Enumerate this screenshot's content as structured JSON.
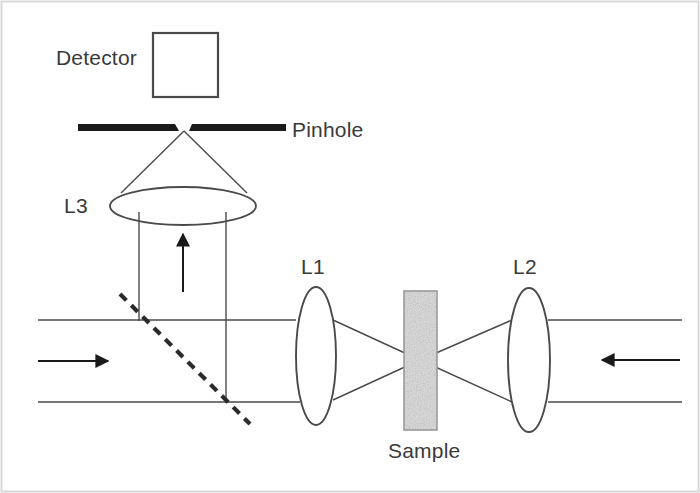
{
  "figure": {
    "kind": "optical-setup-diagram",
    "background_color": "#ffffff",
    "border_color": "#d8d8d8",
    "stroke_color": "#4a4a4a",
    "text_color": "#3a3a3a",
    "solid_black": "#1a1a1a",
    "sample_fill": "#d2d2d2",
    "sample_stroke": "#9a9a9a",
    "canvas": {
      "width": 700,
      "height": 493
    }
  },
  "labels": {
    "detector": "Detector",
    "pinhole": "Pinhole",
    "l3": "L3",
    "l1": "L1",
    "l2": "L2",
    "sample": "Sample"
  },
  "components": {
    "detector_box": {
      "x": 153,
      "y": 33,
      "width": 65,
      "height": 64
    },
    "pinhole_left_bar": {
      "x1": 78,
      "y1": 127,
      "x2": 177,
      "y2": 127,
      "thickness": 7
    },
    "pinhole_right_bar": {
      "x1": 191,
      "y1": 127,
      "x2": 285,
      "y2": 127,
      "thickness": 7
    },
    "pinhole_gap": {
      "center_x": 184,
      "y": 128,
      "width": 14
    },
    "lens_l3": {
      "cx": 183,
      "cy": 206,
      "rx": 73,
      "ry": 19,
      "orientation": "horizontal"
    },
    "lens_l1": {
      "cx": 316,
      "cy": 356,
      "rx": 20,
      "ry": 69,
      "orientation": "vertical"
    },
    "lens_l2": {
      "cx": 529,
      "cy": 360,
      "rx": 21,
      "ry": 72,
      "orientation": "vertical"
    },
    "sample_block": {
      "x": 404,
      "y": 291,
      "width": 33,
      "height": 139
    },
    "beamsplitter": {
      "x1": 120,
      "y1": 294,
      "x2": 250,
      "y2": 424,
      "style": "dashed",
      "angle_deg": 45
    },
    "focal_point": {
      "x": 420,
      "y": 360
    }
  },
  "beams": {
    "horizontal_top_y": 320,
    "horizontal_bottom_y": 402,
    "left_edge_x": 38,
    "right_edge_x": 682,
    "vertical_left_x": 139,
    "vertical_right_x": 226,
    "vertical_top_y": 218,
    "vertical_bottom_y": 402
  },
  "arrows": [
    {
      "name": "input-beam-arrow",
      "direction": "right",
      "x1": 38,
      "y1": 361,
      "x2": 110,
      "y2": 361
    },
    {
      "name": "return-beam-arrow",
      "direction": "left",
      "x1": 680,
      "y1": 360,
      "x2": 600,
      "y2": 360
    },
    {
      "name": "detection-beam-arrow",
      "direction": "up",
      "x1": 183,
      "y1": 292,
      "x2": 183,
      "y2": 232
    },
    {
      "name": "pinhole-cone-apex",
      "direction": "up",
      "x1": 184,
      "y1": 190,
      "x2": 184,
      "y2": 131
    }
  ],
  "cones": {
    "l3_to_pinhole": {
      "apex_x": 184,
      "apex_y": 131,
      "base_left_x": 120,
      "base_right_x": 247,
      "base_y": 192
    },
    "l1_to_focus": {
      "lens_top_y": 318,
      "lens_bottom_y": 400,
      "lens_x": 331,
      "focus_x": 420,
      "focus_y": 360
    },
    "l2_to_focus": {
      "lens_top_y": 320,
      "lens_bottom_y": 402,
      "lens_x": 514,
      "focus_x": 420,
      "focus_y": 360
    }
  }
}
